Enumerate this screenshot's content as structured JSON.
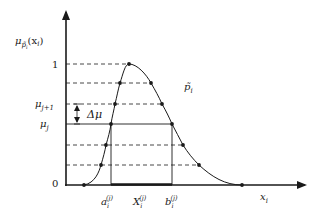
{
  "diagram": {
    "y_axis_label": {
      "base": "μ",
      "sub": "p̃",
      "subsub": "i",
      "arg": "(x",
      "argsub": "i",
      "close": ")"
    },
    "x_axis_label": {
      "base": "x",
      "sub": "i"
    },
    "y_ticks": {
      "one": "1",
      "mu_j1": {
        "base": "μ",
        "sub": "j+1"
      },
      "mu_j": {
        "base": "μ",
        "sub": "j"
      },
      "zero": "0"
    },
    "delta_label": "Δμ",
    "curve_label": {
      "base": "p̃",
      "sub": "i"
    },
    "x_labels": {
      "a": {
        "base": "a",
        "sub": "i",
        "sup": "(j)"
      },
      "X": {
        "base": "X",
        "sub": "i",
        "sup": "(j)"
      },
      "b": {
        "base": "b",
        "sub": "i",
        "sup": "(j)"
      }
    },
    "levels_y_px": [
      64,
      83,
      104,
      124,
      145,
      165,
      185
    ],
    "left_points": [
      [
        84,
        185
      ],
      [
        101,
        165
      ],
      [
        106,
        145
      ],
      [
        111,
        124
      ],
      [
        115,
        104
      ],
      [
        120,
        83
      ],
      [
        129,
        64
      ]
    ],
    "right_points": [
      [
        151,
        83
      ],
      [
        162,
        104
      ],
      [
        172,
        124
      ],
      [
        183,
        145
      ],
      [
        199,
        165
      ],
      [
        242,
        185
      ]
    ],
    "colors": {
      "ink": "#1a1a1a",
      "background": "#ffffff"
    }
  }
}
